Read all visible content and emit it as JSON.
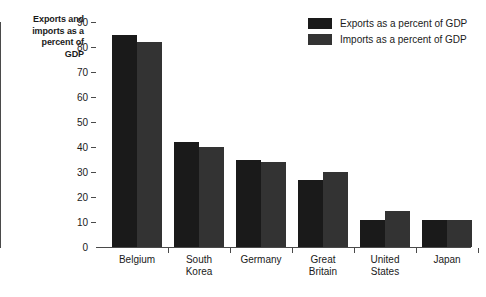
{
  "chart_data": {
    "type": "bar",
    "title": "Exports and imports as a percent of GDP",
    "xlabel": "",
    "ylabel": "Exports and imports as a percent of GDP",
    "ylim": [
      0,
      90
    ],
    "yticks": [
      0,
      10,
      20,
      30,
      40,
      50,
      60,
      70,
      80,
      90
    ],
    "grid": false,
    "legend_position": "top-right",
    "categories": [
      "Belgium",
      "South Korea",
      "Germany",
      "Great Britain",
      "United States",
      "Japan"
    ],
    "series": [
      {
        "name": "Exports as a percent of GDP",
        "color": "#1a1a1a",
        "values": [
          85,
          42,
          35,
          27,
          11,
          11
        ]
      },
      {
        "name": "Imports as a percent of GDP",
        "color": "#333333",
        "values": [
          82,
          40,
          34,
          30,
          14.5,
          10.8
        ]
      }
    ]
  },
  "axis": {
    "title_line1": "Exports and",
    "title_line2": "imports as a",
    "title_line3": "percent of",
    "title_line4": "GDP"
  },
  "categories_display": [
    {
      "line1": "Belgium",
      "line2": ""
    },
    {
      "line1": "South",
      "line2": "Korea"
    },
    {
      "line1": "Germany",
      "line2": ""
    },
    {
      "line1": "Great",
      "line2": "Britain"
    },
    {
      "line1": "United",
      "line2": "States"
    },
    {
      "line1": "Japan",
      "line2": ""
    }
  ]
}
